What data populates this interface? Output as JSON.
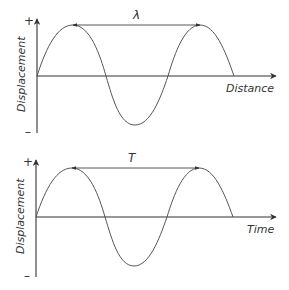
{
  "diagrams": [
    {
      "name": "wavelength-graph",
      "y_axis_label": "Displacement",
      "x_axis_label": "Distance",
      "span_label": "λ",
      "plus_sign": "+",
      "minus_sign": "–"
    },
    {
      "name": "period-graph",
      "y_axis_label": "Displacement",
      "x_axis_label": "Time",
      "span_label": "T",
      "plus_sign": "+",
      "minus_sign": "–"
    }
  ],
  "colors": {
    "line": "#333333",
    "wave": "#555555",
    "background": "#ffffff"
  }
}
